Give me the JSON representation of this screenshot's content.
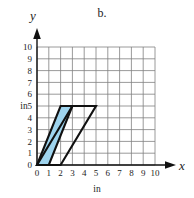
{
  "figure": {
    "part_label": "b.",
    "x_axis": {
      "name": "x",
      "unit_label": "in",
      "ticks": [
        "0",
        "1",
        "2",
        "3",
        "4",
        "5",
        "6",
        "7",
        "8",
        "9",
        "10"
      ],
      "min": 0,
      "max": 10
    },
    "y_axis": {
      "name": "y",
      "unit_label": "in",
      "ticks": [
        "0",
        "1",
        "2",
        "3",
        "4",
        "5",
        "6",
        "7",
        "8",
        "9",
        "10"
      ],
      "min": 0,
      "max": 10
    },
    "grid": {
      "show": true,
      "line_color": "#808080",
      "cell_size_units": 1
    },
    "colors": {
      "shape_fill": "#9fd4ee",
      "shape_stroke": "#111111",
      "grid": "#808080",
      "axis": "#111111",
      "background": "#ffffff"
    }
  },
  "chart_data": {
    "type": "scatter",
    "title": "",
    "subtitle": "b.",
    "xlabel": "in",
    "ylabel": "in",
    "xlim": [
      0,
      10
    ],
    "ylim": [
      0,
      10
    ],
    "grid": true,
    "legend": "none",
    "annotations": [],
    "shapes": [
      {
        "name": "narrow-parallelogram",
        "kind": "parallelogram",
        "filled": true,
        "fill": "#9fd4ee",
        "stroke": "#111111",
        "vertices": [
          [
            0,
            0
          ],
          [
            1,
            0
          ],
          [
            3,
            5
          ],
          [
            2,
            5
          ]
        ],
        "base_in": 1,
        "height_in": 5
      },
      {
        "name": "wide-parallelogram",
        "kind": "parallelogram",
        "filled": false,
        "fill": "none",
        "stroke": "#111111",
        "vertices": [
          [
            0,
            0
          ],
          [
            2,
            0
          ],
          [
            5,
            5
          ],
          [
            3,
            5
          ]
        ],
        "base_in": 2,
        "height_in": 5
      }
    ]
  }
}
